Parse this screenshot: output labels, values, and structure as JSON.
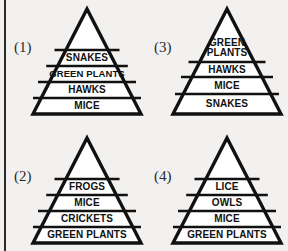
{
  "figure": {
    "background_color": "#f2f1ef",
    "line_color": "#111111",
    "margin_rule_color": "#2b2b2b"
  },
  "pyramids": [
    {
      "index_label": "(1)",
      "name": "pyramid-1",
      "bands": [
        {
          "label": "SNAKES"
        },
        {
          "label": "GREEN PLANTS"
        },
        {
          "label": "HAWKS"
        },
        {
          "label": "MICE"
        }
      ]
    },
    {
      "index_label": "(3)",
      "name": "pyramid-3",
      "bands": [
        {
          "label": "GREEN PLANTS"
        },
        {
          "label": "HAWKS"
        },
        {
          "label": "MICE"
        },
        {
          "label": "SNAKES"
        }
      ]
    },
    {
      "index_label": "(2)",
      "name": "pyramid-2",
      "bands": [
        {
          "label": "FROGS"
        },
        {
          "label": "MICE"
        },
        {
          "label": "CRICKETS"
        },
        {
          "label": "GREEN PLANTS"
        }
      ]
    },
    {
      "index_label": "(4)",
      "name": "pyramid-4",
      "bands": [
        {
          "label": "LICE"
        },
        {
          "label": "OWLS"
        },
        {
          "label": "MICE"
        },
        {
          "label": "GREEN PLANTS"
        }
      ]
    }
  ]
}
